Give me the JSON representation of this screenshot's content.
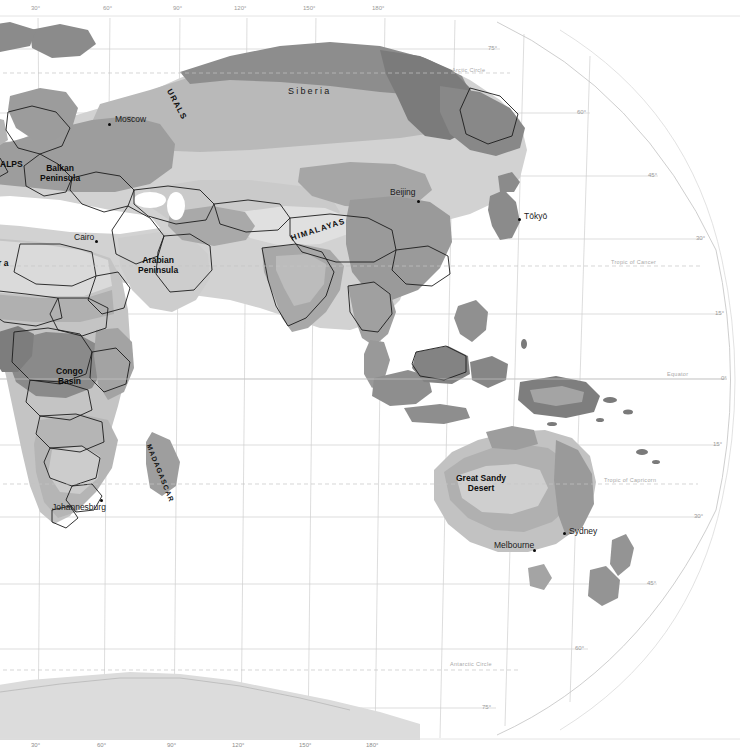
{
  "map": {
    "title": "World map — Eastern Hemisphere",
    "projection": "pseudo-cylindrical (Robinson-like)",
    "style": "grayscale thematic shading",
    "colors": {
      "background": "#ffffff",
      "ocean": "#ffffff",
      "land_lightest": "#e3e3e3",
      "land_light": "#cfcfcf",
      "land_mid": "#b4b4b4",
      "land_dark": "#8f8f8f",
      "land_darkest": "#6f6f6f",
      "border": "#1a1a1a",
      "graticule": "#c9c9c9",
      "graticule_faint": "#dcdcdc",
      "label": "#111111",
      "label_faint": "#9a9a9a"
    },
    "longitude_labels_top": [
      {
        "text": "30°",
        "x": 38
      },
      {
        "text": "60°",
        "x": 110
      },
      {
        "text": "90°",
        "x": 180
      },
      {
        "text": "120°",
        "x": 243
      },
      {
        "text": "150°",
        "x": 312
      },
      {
        "text": "180°",
        "x": 381
      }
    ],
    "longitude_labels_bottom": [
      {
        "text": "30°",
        "x": 38
      },
      {
        "text": "60°",
        "x": 104
      },
      {
        "text": "90°",
        "x": 174
      },
      {
        "text": "120°",
        "x": 241
      },
      {
        "text": "150°",
        "x": 308
      },
      {
        "text": "180°",
        "x": 375
      }
    ],
    "latitude_labels_right": [
      {
        "text": "75°",
        "x": 488,
        "y": 49
      },
      {
        "text": "60°",
        "x": 577,
        "y": 113
      },
      {
        "text": "45°",
        "x": 648,
        "y": 176
      },
      {
        "text": "30°",
        "x": 696,
        "y": 239
      },
      {
        "text": "15°",
        "x": 715,
        "y": 314
      },
      {
        "text": "0°",
        "x": 720,
        "y": 379
      },
      {
        "text": "15°",
        "x": 713,
        "y": 445
      },
      {
        "text": "30°",
        "x": 694,
        "y": 517
      },
      {
        "text": "45°",
        "x": 647,
        "y": 584
      },
      {
        "text": "60°",
        "x": 575,
        "y": 649
      },
      {
        "text": "75°",
        "x": 482,
        "y": 708
      }
    ],
    "reference_circles": [
      {
        "text": "Arctic Circle",
        "x": 452,
        "y": 73
      },
      {
        "text": "Tropic of Cancer",
        "x": 611,
        "y": 263
      },
      {
        "text": "Equator",
        "x": 667,
        "y": 375
      },
      {
        "text": "Tropic of Capricorn",
        "x": 604,
        "y": 481
      },
      {
        "text": "Antarctic Circle",
        "x": 450,
        "y": 666
      }
    ],
    "cities": [
      {
        "name": "Moscow",
        "label_x": 115,
        "label_y": 118,
        "dot_x": 108,
        "dot_y": 123
      },
      {
        "name": "Beijing",
        "label_x": 392,
        "label_y": 191,
        "dot_x": 417,
        "dot_y": 200
      },
      {
        "name": "Tōkyō",
        "label_x": 524,
        "label_y": 215,
        "dot_x": 518,
        "dot_y": 218
      },
      {
        "name": "Cairo",
        "label_x": 78,
        "label_y": 235,
        "dot_x": 95,
        "dot_y": 240
      },
      {
        "name": "Johannesburg",
        "label_x": 54,
        "label_y": 506,
        "dot_x": 100,
        "dot_y": 499
      },
      {
        "name": "Sydney",
        "label_x": 569,
        "label_y": 530,
        "dot_x": 564,
        "dot_y": 533
      },
      {
        "name": "Melbourne",
        "label_x": 495,
        "label_y": 543,
        "dot_x": 533,
        "dot_y": 549
      }
    ],
    "regions": [
      {
        "name": "Siberia",
        "x": 288,
        "y": 90,
        "type": "area"
      },
      {
        "name": "URALS",
        "x": 172,
        "y": 88,
        "type": "range-rotated"
      },
      {
        "name": "HIMALAYAS",
        "x": 290,
        "y": 233,
        "type": "range-rotated"
      },
      {
        "name": "ALPS",
        "x": 0,
        "y": 163,
        "type": "range"
      },
      {
        "name": "Balkan\nPeninsula",
        "x": 44,
        "y": 167,
        "type": "region"
      },
      {
        "name": "Arabian\nPeninsula",
        "x": 142,
        "y": 259,
        "type": "region"
      },
      {
        "name": "Congo\nBasin",
        "x": 58,
        "y": 370,
        "type": "region"
      },
      {
        "name": "MADAGASCAR",
        "x": 152,
        "y": 443,
        "type": "island-rotated"
      },
      {
        "name": "Great Sandy\nDesert",
        "x": 460,
        "y": 477,
        "type": "region"
      },
      {
        "name": "r a",
        "x": 0,
        "y": 262,
        "type": "region-clipped"
      }
    ]
  }
}
